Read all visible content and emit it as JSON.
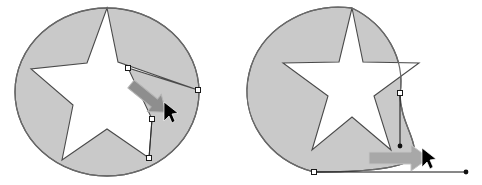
{
  "figure": {
    "width": 482,
    "height": 185,
    "background_color": "#ffffff"
  },
  "colors": {
    "shape_fill": "#c9c9c9",
    "shape_stroke": "#555555",
    "cutout_fill": "#ffffff",
    "handle_line": "#2b2b2b",
    "handle_square_fill": "#ffffff",
    "handle_square_stroke": "#1a1a1a",
    "handle_dot_fill": "#111111",
    "drag_arrow": "#8e8e8e",
    "drag_arrow_outline": "#b8b8b8",
    "cursor_fill": "#000000"
  },
  "panels": [
    {
      "id": "left-panel",
      "name": "node-drag-panel",
      "label": "Dragging a star node outward",
      "circle": {
        "cx": 107,
        "cy": 92,
        "rx": 92,
        "ry": 84
      },
      "star": {
        "points": 5,
        "outer_radius": 84,
        "inner_radius": 36,
        "rotation_deg": -90,
        "dragged_point_index": 1,
        "dragged_to": {
          "x": 198,
          "y": 90
        }
      },
      "handles": [
        {
          "name": "anchor-node-upper",
          "type": "square",
          "x": 128,
          "y": 68
        },
        {
          "name": "anchor-node-dragged",
          "type": "square",
          "x": 198,
          "y": 90
        },
        {
          "name": "anchor-node-mid",
          "type": "square",
          "x": 152,
          "y": 119
        },
        {
          "name": "anchor-node-lower",
          "type": "square",
          "x": 149,
          "y": 158
        }
      ],
      "drag_arrow": {
        "name": "drag-direction-arrow",
        "from": {
          "x": 131,
          "y": 84
        },
        "to": {
          "x": 168,
          "y": 114
        },
        "direction": "down-right"
      },
      "cursor": {
        "name": "mouse-cursor",
        "x": 166,
        "y": 108
      }
    },
    {
      "id": "right-panel",
      "name": "curve-drag-panel",
      "label": "Dragging a circle segment into a curve",
      "circle": {
        "cx": 352,
        "cy": 92,
        "rx": 92,
        "ry": 84
      },
      "star": {
        "points": 5,
        "outer_radius": 84,
        "inner_radius": 36,
        "rotation_deg": -90
      },
      "handles": [
        {
          "name": "anchor-node-right",
          "type": "square",
          "x": 400,
          "y": 94
        },
        {
          "name": "control-point-right",
          "type": "dot",
          "x": 400,
          "y": 146
        },
        {
          "name": "anchor-node-bottom",
          "type": "square",
          "x": 314,
          "y": 172
        },
        {
          "name": "control-point-bottom",
          "type": "dot",
          "x": 466,
          "y": 172
        }
      ],
      "curve": {
        "name": "dragged-bezier-curve",
        "start": {
          "x": 400,
          "y": 94
        },
        "control1": {
          "x": 400,
          "y": 146
        },
        "control2": {
          "x": 466,
          "y": 172
        },
        "end": {
          "x": 314,
          "y": 172
        }
      },
      "drag_arrow": {
        "name": "drag-direction-arrow",
        "from": {
          "x": 369,
          "y": 158
        },
        "to": {
          "x": 428,
          "y": 158
        },
        "direction": "right"
      },
      "cursor": {
        "name": "mouse-cursor",
        "x": 424,
        "y": 154
      }
    }
  ]
}
